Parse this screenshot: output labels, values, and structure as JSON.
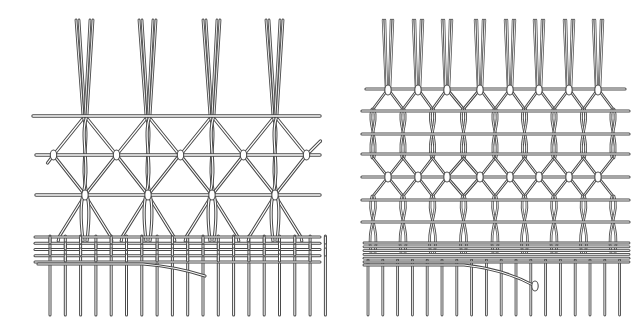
{
  "figure": {
    "width": 633,
    "height": 331,
    "background": "#ffffff",
    "stroke_color": "#4a4a4a",
    "fill_color": "#ffffff",
    "panels": [
      {
        "id": "left-panel",
        "pattern": "diamond-mesh",
        "bundle_centers": [
          85,
          148,
          212,
          275
        ],
        "bundle_top": 20,
        "cords_per_bundle": 4,
        "bars": [
          116,
          155,
          195
        ],
        "bar_x": [
          33,
          320
        ],
        "knot_rows": [
          155,
          195
        ],
        "weft_band": {
          "top": 237,
          "bottom": 262,
          "lines": 5
        },
        "loose_weft": {
          "y": 264,
          "x_start": 38,
          "end": [
            205,
            276
          ]
        },
        "fringe": {
          "x_start": 50,
          "count": 19,
          "spacing": 15.3,
          "top": 236,
          "bottom": 315
        }
      },
      {
        "id": "right-panel",
        "pattern": "hexagonal-mesh",
        "bundle_centers": [
          388,
          418,
          447,
          480,
          510,
          539,
          569,
          598
        ],
        "bundle_top": 20,
        "cords_per_bundle": 4,
        "bars": [
          89,
          111,
          134,
          154,
          177,
          200,
          222
        ],
        "bar_x": [
          362,
          625
        ],
        "weft_band": {
          "top": 243,
          "bottom": 262,
          "lines": 6
        },
        "loose_weft": {
          "y": 265,
          "x_start": 364,
          "end": [
            535,
            286
          ]
        },
        "fringe": {
          "x_start": 368,
          "count": 18,
          "spacing": 14.8,
          "top": 260,
          "bottom": 315
        }
      }
    ]
  }
}
